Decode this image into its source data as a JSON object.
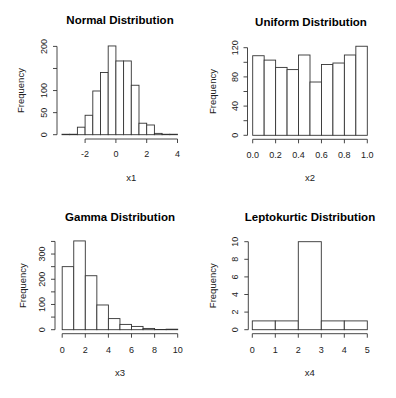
{
  "figure": {
    "width": 396,
    "height": 398,
    "background": "#ffffff",
    "bar_fill": "#ffffff",
    "bar_stroke": "#333333"
  },
  "chart_data": [
    {
      "type": "bar",
      "subtype": "histogram",
      "title": "Normal Distribution",
      "xlabel": "x1",
      "ylabel": "Frequency",
      "bin_edges": [
        -3.5,
        -3,
        -2.5,
        -2,
        -1.5,
        -1,
        -0.5,
        0,
        0.5,
        1,
        1.5,
        2,
        2.5,
        3,
        3.5,
        4
      ],
      "values": [
        1,
        1,
        17,
        44,
        99,
        141,
        201,
        167,
        167,
        112,
        26,
        22,
        3,
        1,
        1
      ],
      "xticks": [
        -2,
        0,
        2,
        4
      ],
      "xtick_labels": [
        "-2",
        "0",
        "2",
        "4"
      ],
      "yticks": [
        0,
        50,
        100,
        150,
        200
      ],
      "ytick_labels": [
        "0",
        "50",
        "100",
        "",
        "200"
      ],
      "xlim": [
        -3.5,
        4
      ],
      "ylim": [
        0,
        200
      ],
      "grid": false,
      "layout": {
        "axis_x": 57,
        "plot_left": 62,
        "px_per_x": 15.4,
        "x_origin_val": -3.5,
        "baseline_y": 134.7,
        "px_per_y": 0.4415,
        "xaxis_y": 139,
        "title_x": 120,
        "title_y": 24,
        "xlabel_y": 181,
        "ylabel_x": 21,
        "tick_label_y": 157,
        "ytick_label_x": 44
      }
    },
    {
      "type": "bar",
      "subtype": "histogram",
      "title": "Uniform Distribution",
      "xlabel": "x2",
      "ylabel": "Frequency",
      "bin_edges": [
        0.0,
        0.1,
        0.2,
        0.3,
        0.4,
        0.5,
        0.6,
        0.7,
        0.8,
        0.9,
        1.0
      ],
      "values": [
        109,
        103,
        93,
        90,
        110,
        73,
        97,
        99,
        110,
        122
      ],
      "xticks": [
        0.0,
        0.2,
        0.4,
        0.6,
        0.8,
        1.0
      ],
      "xtick_labels": [
        "0.0",
        "0.2",
        "0.4",
        "0.6",
        "0.8",
        "1.0"
      ],
      "yticks": [
        0,
        20,
        40,
        60,
        80,
        100,
        120
      ],
      "ytick_labels": [
        "0",
        "",
        "40",
        "",
        "80",
        "",
        "120"
      ],
      "xlim": [
        0,
        1
      ],
      "ylim": [
        0,
        120
      ],
      "grid": false,
      "layout": {
        "axis_x": 247.5,
        "plot_left": 252.7,
        "px_per_x": 114.6,
        "x_origin_val": 0,
        "baseline_y": 135.3,
        "px_per_y": 0.73,
        "xaxis_y": 139.3,
        "title_x": 311,
        "title_y": 26,
        "xlabel_y": 181,
        "ylabel_x": 213,
        "tick_label_y": 158,
        "ytick_label_x": 235
      }
    },
    {
      "type": "bar",
      "subtype": "histogram",
      "title": "Gamma Distribution",
      "xlabel": "x3",
      "ylabel": "Frequency",
      "bin_edges": [
        0,
        1,
        2,
        3,
        4,
        5,
        6,
        7,
        8,
        9,
        10
      ],
      "values": [
        250,
        352,
        214,
        98,
        44,
        21,
        13,
        5,
        1,
        2
      ],
      "xticks": [
        0,
        2,
        4,
        6,
        8,
        10
      ],
      "xtick_labels": [
        "0",
        "2",
        "4",
        "6",
        "8",
        "10"
      ],
      "yticks": [
        0,
        50,
        100,
        150,
        200,
        250,
        300,
        350
      ],
      "ytick_labels": [
        "0",
        "",
        "100",
        "",
        "200",
        "",
        "300",
        ""
      ],
      "xlim": [
        0,
        10
      ],
      "ylim": [
        0,
        352
      ],
      "grid": false,
      "layout": {
        "axis_x": 55,
        "plot_left": 62.2,
        "px_per_x": 11.55,
        "x_origin_val": 0,
        "baseline_y": 329.7,
        "px_per_y": 0.2522,
        "xaxis_y": 333.7,
        "title_x": 120,
        "title_y": 221,
        "xlabel_y": 376,
        "ylabel_x": 23,
        "tick_label_y": 353,
        "ytick_label_x": 42
      }
    },
    {
      "type": "bar",
      "subtype": "histogram",
      "title": "Leptokurtic Distribution",
      "xlabel": "x4",
      "ylabel": "Frequency",
      "bin_edges": [
        0,
        1,
        2,
        3,
        4,
        5
      ],
      "values": [
        1,
        1,
        10,
        1,
        1
      ],
      "xticks": [
        0,
        1,
        2,
        3,
        4,
        5
      ],
      "xtick_labels": [
        "0",
        "1",
        "2",
        "3",
        "4",
        "5"
      ],
      "yticks": [
        0,
        2,
        4,
        6,
        8,
        10
      ],
      "ytick_labels": [
        "0",
        "2",
        "4",
        "6",
        "8",
        "10"
      ],
      "xlim": [
        0,
        5
      ],
      "ylim": [
        0,
        10
      ],
      "grid": false,
      "layout": {
        "axis_x": 248.3,
        "plot_left": 252.3,
        "px_per_x": 23,
        "x_origin_val": 0,
        "baseline_y": 329.7,
        "px_per_y": 8.8,
        "xaxis_y": 333.7,
        "title_x": 310,
        "title_y": 221,
        "xlabel_y": 376,
        "ylabel_x": 213,
        "tick_label_y": 353,
        "ytick_label_x": 235
      }
    }
  ]
}
